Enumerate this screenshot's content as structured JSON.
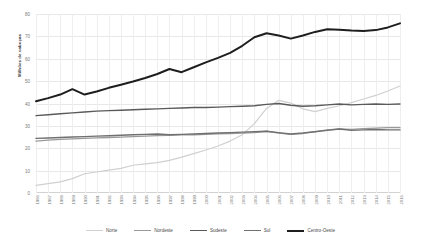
{
  "chart_data": {
    "type": "line",
    "title": "",
    "xlabel": "",
    "ylabel": "Milhões de cabeças",
    "ylim": [
      0,
      80
    ],
    "yticks": [
      0,
      10,
      20,
      30,
      40,
      50,
      60,
      70,
      80
    ],
    "grid": true,
    "legend_position": "bottom",
    "x": [
      1986,
      1987,
      1988,
      1989,
      1990,
      1991,
      1992,
      1993,
      1994,
      1995,
      1996,
      1997,
      1998,
      1999,
      2000,
      2001,
      2002,
      2003,
      2004,
      2005,
      2006,
      2007,
      2008,
      2009,
      2010,
      2011,
      2012,
      2013,
      2014,
      2015,
      2016
    ],
    "categories": [
      "1986",
      "1987",
      "1988",
      "1989",
      "1990",
      "1991",
      "1992",
      "1993",
      "1994",
      "1995",
      "1996",
      "1997",
      "1998",
      "1999",
      "2000",
      "2001",
      "2002",
      "2003",
      "2004",
      "2005",
      "2006",
      "2007",
      "2008",
      "2009",
      "2010",
      "2011",
      "2012",
      "2013",
      "2014",
      "2015",
      "2016"
    ],
    "series": [
      {
        "name": "Norte",
        "color": "#d0d0d0",
        "width": 1.2,
        "values": [
          3.4,
          4.2,
          5.0,
          6.4,
          8.6,
          9.4,
          10.2,
          11.0,
          12.4,
          13.0,
          13.6,
          14.6,
          16.0,
          17.6,
          19.2,
          21.0,
          23.2,
          26.0,
          31.0,
          37.8,
          41.4,
          40.2,
          37.6,
          36.4,
          37.8,
          39.0,
          40.4,
          42.0,
          43.6,
          45.6,
          47.8
        ]
      },
      {
        "name": "Nordeste",
        "color": "#9a9a9a",
        "width": 1.3,
        "values": [
          23.2,
          23.6,
          24.0,
          24.2,
          24.4,
          24.6,
          24.8,
          25.0,
          25.2,
          25.4,
          25.6,
          25.8,
          26.0,
          26.0,
          26.2,
          26.4,
          26.6,
          26.8,
          27.0,
          27.6,
          26.8,
          26.2,
          26.6,
          27.4,
          28.2,
          28.6,
          28.4,
          28.8,
          29.0,
          29.2,
          29.2
        ]
      },
      {
        "name": "Sudeste",
        "color": "#5a5a5a",
        "width": 1.4,
        "values": [
          34.6,
          35.0,
          35.4,
          35.8,
          36.2,
          36.6,
          36.8,
          37.0,
          37.2,
          37.4,
          37.6,
          37.8,
          38.0,
          38.2,
          38.2,
          38.4,
          38.6,
          38.8,
          39.0,
          39.6,
          40.0,
          39.2,
          38.8,
          39.0,
          39.4,
          39.8,
          39.4,
          39.6,
          39.8,
          39.6,
          39.8
        ]
      },
      {
        "name": "Sul",
        "color": "#707070",
        "width": 1.4,
        "values": [
          24.4,
          24.6,
          24.8,
          25.0,
          25.2,
          25.4,
          25.6,
          25.8,
          26.0,
          26.2,
          26.4,
          26.0,
          26.2,
          26.4,
          26.6,
          26.8,
          27.0,
          27.2,
          27.4,
          27.6,
          27.0,
          26.4,
          26.8,
          27.4,
          28.0,
          28.6,
          28.0,
          28.2,
          28.4,
          28.2,
          28.2
        ]
      },
      {
        "name": "Centro-Oeste",
        "color": "#1e1e1e",
        "width": 2.0,
        "values": [
          41.0,
          42.4,
          44.0,
          46.4,
          44.0,
          45.4,
          47.0,
          48.4,
          49.8,
          51.4,
          53.2,
          55.4,
          54.0,
          56.2,
          58.4,
          60.4,
          62.6,
          65.8,
          69.6,
          71.4,
          70.4,
          69.0,
          70.4,
          72.0,
          73.2,
          73.0,
          72.6,
          72.4,
          72.8,
          74.0,
          75.8
        ]
      }
    ]
  },
  "legend": {
    "items": [
      {
        "label": "Norte"
      },
      {
        "label": "Nordeste"
      },
      {
        "label": "Sudeste"
      },
      {
        "label": "Sul"
      },
      {
        "label": "Centro-Oeste"
      }
    ]
  }
}
